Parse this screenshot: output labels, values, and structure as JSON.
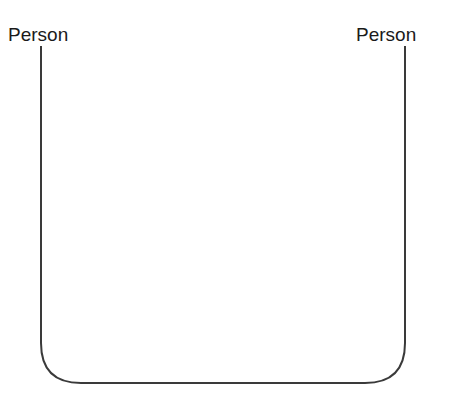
{
  "diagram": {
    "left_node": {
      "label": "Person"
    },
    "right_node": {
      "label": "Person"
    },
    "connector": {
      "type": "u-shaped-line",
      "stroke": "#3a3a3a",
      "corner_radius": 40
    }
  }
}
